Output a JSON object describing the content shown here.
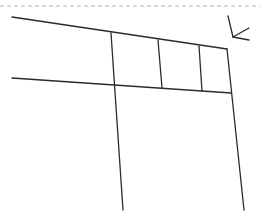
{
  "diagram": {
    "colors": {
      "background": "#ffffff",
      "stroke": "#2b2b2b",
      "dashed_border": "#b0b0b0"
    },
    "dashed_line": {
      "x1": 0,
      "y1": 6,
      "x2": 260,
      "y2": 6
    },
    "lines": [
      {
        "name": "top-edge-line",
        "x1": 12,
        "y1": 17,
        "x2": 227,
        "y2": 49
      },
      {
        "name": "middle-horizontal-line",
        "x1": 12,
        "y1": 78,
        "x2": 231,
        "y2": 93
      },
      {
        "name": "left-vertical-line",
        "x1": 111,
        "y1": 33,
        "x2": 123,
        "y2": 210
      },
      {
        "name": "divider-vertical-line-1",
        "x1": 158,
        "y1": 40,
        "x2": 162,
        "y2": 88
      },
      {
        "name": "divider-vertical-line-2",
        "x1": 199,
        "y1": 46,
        "x2": 202,
        "y2": 91
      },
      {
        "name": "right-vertical-line",
        "x1": 227,
        "y1": 49,
        "x2": 244,
        "y2": 210
      }
    ],
    "arrow": {
      "shaft": {
        "x1": 228,
        "y1": 16,
        "x2": 233,
        "y2": 37
      },
      "head_a": {
        "x1": 233,
        "y1": 37,
        "x2": 249,
        "y2": 28
      },
      "head_b": {
        "x1": 233,
        "y1": 37,
        "x2": 249,
        "y2": 40
      }
    }
  }
}
